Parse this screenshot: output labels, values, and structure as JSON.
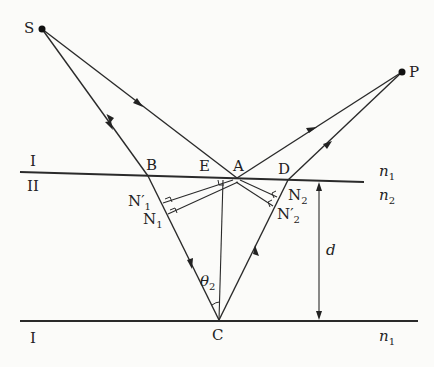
{
  "diagram": {
    "points": {
      "S": {
        "label": "S",
        "x": 42,
        "y": 29
      },
      "P": {
        "label": "P",
        "x": 402,
        "y": 72
      },
      "B": {
        "label": "B",
        "x": 148,
        "y": 176
      },
      "E": {
        "label": "E",
        "x": 214,
        "y": 177
      },
      "A": {
        "label": "A",
        "x": 237,
        "y": 178
      },
      "D": {
        "label": "D",
        "x": 288,
        "y": 180
      },
      "C": {
        "label": "C",
        "x": 219,
        "y": 320
      },
      "N1": {
        "label": "N",
        "sub": "1"
      },
      "N1p": {
        "label": "N′",
        "sub": "1"
      },
      "N2": {
        "label": "N",
        "sub": "2"
      },
      "N2p": {
        "label": "N′",
        "sub": "2"
      }
    },
    "media": {
      "top_region": "I",
      "film_region": "II",
      "bottom_region": "I",
      "n_top": "n",
      "n_top_sub": "1",
      "n_film": "n",
      "n_film_sub": "2",
      "n_bottom": "n",
      "n_bottom_sub": "1"
    },
    "angle": {
      "symbol": "θ",
      "sub": "2"
    },
    "thickness": {
      "symbol": "d"
    }
  }
}
